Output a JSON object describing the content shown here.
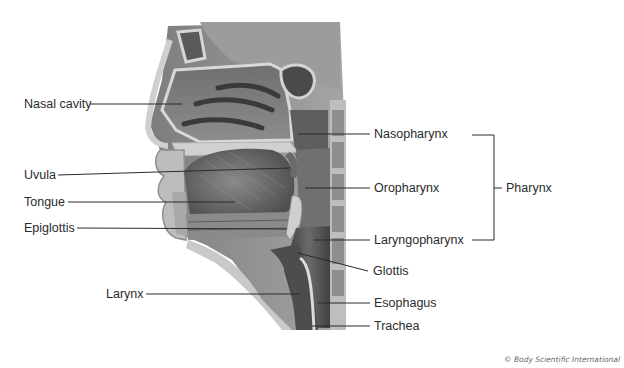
{
  "diagram": {
    "labels_left": [
      {
        "id": "nasal-cavity",
        "text": "Nasal cavity"
      },
      {
        "id": "uvula",
        "text": "Uvula"
      },
      {
        "id": "tongue",
        "text": "Tongue"
      },
      {
        "id": "epiglottis",
        "text": "Epiglottis"
      },
      {
        "id": "larynx",
        "text": "Larynx"
      }
    ],
    "labels_right": [
      {
        "id": "nasopharynx",
        "text": "Nasopharynx"
      },
      {
        "id": "oropharynx",
        "text": "Oropharynx"
      },
      {
        "id": "laryngopharynx",
        "text": "Laryngopharynx"
      },
      {
        "id": "glottis",
        "text": "Glottis"
      },
      {
        "id": "esophagus",
        "text": "Esophagus"
      },
      {
        "id": "trachea",
        "text": "Trachea"
      }
    ],
    "group_bracket": {
      "text": "Pharynx",
      "spans": [
        "Nasopharynx",
        "Oropharynx",
        "Laryngopharynx"
      ]
    },
    "credit": "© Body Scientific International",
    "colors": {
      "leader_line": "#2b2b2b",
      "label_text": "#2b2b2b",
      "tissue_dark": "#4a4a4a",
      "tissue_mid": "#8a8a8a",
      "bone_light": "#d6d6d6"
    }
  }
}
